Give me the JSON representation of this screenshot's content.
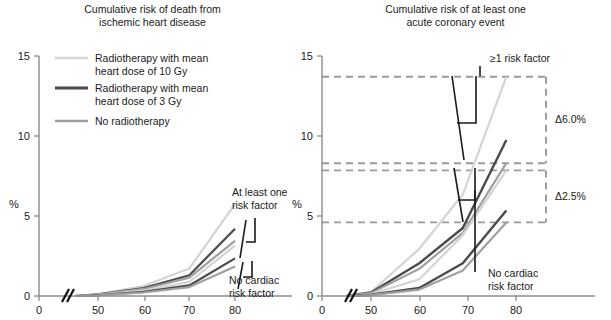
{
  "figure": {
    "y_axis_label": "%",
    "x_ticks": [
      "0",
      "50",
      "60",
      "70",
      "80"
    ],
    "y_ticks": [
      "0",
      "5",
      "10",
      "15"
    ],
    "axis_break_marker": "axis-break"
  },
  "legend": {
    "items": [
      {
        "label_line1": "Radiotherapy with mean",
        "label_line2": "heart dose of 10 Gy",
        "color": "#d4d4d4"
      },
      {
        "label_line1": "Radiotherapy with mean",
        "label_line2": "heart dose of 3 Gy",
        "color": "#4a4a4a"
      },
      {
        "label_line1": "No radiotherapy",
        "label_line2": "",
        "color": "#a0a0a0"
      }
    ]
  },
  "left_panel": {
    "title_line1": "Cumulative risk of death from",
    "title_line2": "ischemic heart disease",
    "annotations": [
      {
        "name": "at-least-one-risk-factor",
        "line1": "At least one",
        "line2": "risk factor"
      },
      {
        "name": "no-cardiac-risk-factor",
        "line1": "No cardiac",
        "line2": "risk factor"
      }
    ]
  },
  "right_panel": {
    "title_line1": "Cumulative risk of at least one",
    "title_line2": "acute coronary event",
    "annotations": [
      {
        "name": "at-least-one-risk-factor",
        "line1": "≥1 risk factor",
        "line2": ""
      },
      {
        "name": "no-cardiac-risk-factor",
        "line1": "No cardiac",
        "line2": "risk factor"
      }
    ],
    "deltas": [
      {
        "name": "delta-upper",
        "label": "Δ6.0%"
      },
      {
        "name": "delta-lower",
        "label": "Δ2.5%"
      }
    ]
  },
  "chart_data": [
    {
      "type": "line",
      "name": "left-chart",
      "title": "Cumulative risk of death from ischemic heart disease",
      "xlabel": "",
      "ylabel": "%",
      "xlim": [
        45,
        84
      ],
      "ylim": [
        0,
        15
      ],
      "x": [
        45,
        50,
        60,
        70,
        80
      ],
      "grid": false,
      "legend_position": "top-left",
      "axis_break": true,
      "series": [
        {
          "name": "10 Gy, at least one risk factor",
          "group": "at-least-one-risk-factor",
          "color": "#d4d4d4",
          "width": 2.2,
          "values": [
            0,
            0.12,
            0.62,
            1.72,
            5.75
          ]
        },
        {
          "name": "3 Gy, at least one risk factor",
          "group": "at-least-one-risk-factor",
          "color": "#4a4a4a",
          "width": 2.2,
          "values": [
            0,
            0.1,
            0.5,
            1.3,
            4.2
          ]
        },
        {
          "name": "None, at least one risk factor",
          "group": "at-least-one-risk-factor",
          "color": "#a0a0a0",
          "width": 2.2,
          "values": [
            0,
            0.09,
            0.44,
            1.15,
            3.45
          ]
        },
        {
          "name": "10 Gy, no cardiac risk factor",
          "group": "no-cardiac-risk-factor",
          "color": "#d4d4d4",
          "width": 2.2,
          "values": [
            0,
            0.07,
            0.33,
            0.88,
            3.15
          ]
        },
        {
          "name": "3 Gy, no cardiac risk factor",
          "group": "no-cardiac-risk-factor",
          "color": "#4a4a4a",
          "width": 2.2,
          "values": [
            0,
            0.05,
            0.26,
            0.66,
            2.35
          ]
        },
        {
          "name": "None, no cardiac risk factor",
          "group": "no-cardiac-risk-factor",
          "color": "#a0a0a0",
          "width": 2.2,
          "values": [
            0,
            0.04,
            0.22,
            0.56,
            1.85
          ]
        }
      ]
    },
    {
      "type": "line",
      "name": "right-chart",
      "title": "Cumulative risk of at least one acute coronary event",
      "xlabel": "",
      "ylabel": "%",
      "xlim": [
        45,
        84
      ],
      "ylim": [
        0,
        15
      ],
      "x": [
        45,
        50,
        60,
        69,
        78
      ],
      "grid": false,
      "legend_position": "none",
      "axis_break": true,
      "reference_lines": [
        13.7,
        8.3,
        7.85,
        4.6
      ],
      "series": [
        {
          "name": "10 Gy, at least one risk factor",
          "group": "at-least-one-risk-factor",
          "color": "#d4d4d4",
          "width": 2.2,
          "values": [
            0,
            0.25,
            2.95,
            6.35,
            13.7
          ]
        },
        {
          "name": "3 Gy, at least one risk factor",
          "group": "at-least-one-risk-factor",
          "color": "#4a4a4a",
          "width": 2.4,
          "values": [
            0,
            0.22,
            2.05,
            4.25,
            9.75
          ]
        },
        {
          "name": "None, at least one risk factor",
          "group": "at-least-one-risk-factor",
          "color": "#a0a0a0",
          "width": 2.2,
          "values": [
            0,
            0.18,
            1.7,
            3.95,
            8.3
          ]
        },
        {
          "name": "10 Gy, no cardiac risk factor",
          "group": "no-cardiac-risk-factor",
          "color": "#d4d4d4",
          "width": 2.2,
          "values": [
            0,
            0.12,
            1.05,
            3.8,
            7.85
          ]
        },
        {
          "name": "3 Gy, no cardiac risk factor",
          "group": "no-cardiac-risk-factor",
          "color": "#4a4a4a",
          "width": 2.4,
          "values": [
            0,
            0.08,
            0.5,
            2.05,
            5.35
          ]
        },
        {
          "name": "None, no cardiac risk factor",
          "group": "no-cardiac-risk-factor",
          "color": "#a0a0a0",
          "width": 2.2,
          "values": [
            0,
            0.06,
            0.4,
            1.6,
            4.6
          ]
        }
      ]
    }
  ]
}
